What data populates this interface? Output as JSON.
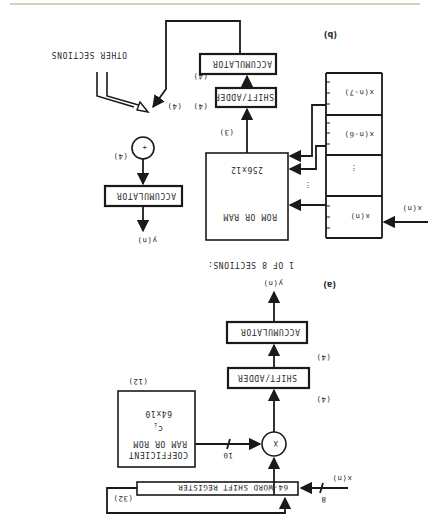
{
  "figure": {
    "orientation": "rotated 180 degrees",
    "part_a": {
      "caption": "(a)",
      "input_label": "x(n)",
      "input_bus_width": "8",
      "shift_register": "64-WORD SHIFT REGISTER",
      "shift_register_count": "(32)",
      "coefficient_store": {
        "line1": "COEFFICIENT",
        "line2": "RAM OR ROM",
        "line3": "c",
        "line3_sub": "i",
        "line4": "64x10",
        "count": "(12)"
      },
      "coeff_bus_width": "10",
      "multiplier_symbol": "X",
      "shift_adder": "SHIFT/ADDER",
      "shift_adder_count": "(4)",
      "accumulator": "ACCUMULATOR",
      "accumulator_count": "(4)",
      "output_label": "y(n)"
    },
    "part_b": {
      "caption": "(b)",
      "section_title": "1 OF 8 SECTIONS:",
      "input_label": "x(n)",
      "register_cells": [
        "x(n)",
        "x(n-6)",
        "x(n-7)"
      ],
      "ellipsis": "⋮",
      "rom": {
        "line1": "ROM OR RAM",
        "line2": "256x12"
      },
      "rom_count": "(3)",
      "shift_adder": "SHIFT/ADDER",
      "shift_adder_count": "(4)",
      "accumulator": "ACCUMULATOR",
      "accumulator_count": "(4)",
      "adder_symbol": "+",
      "adder_count": "(4)",
      "other_sections": "OTHER SECTIONS",
      "final_accumulator": "ACCUMULATOR",
      "final_accumulator_count": "(4)",
      "output_label": "y(n)"
    }
  }
}
